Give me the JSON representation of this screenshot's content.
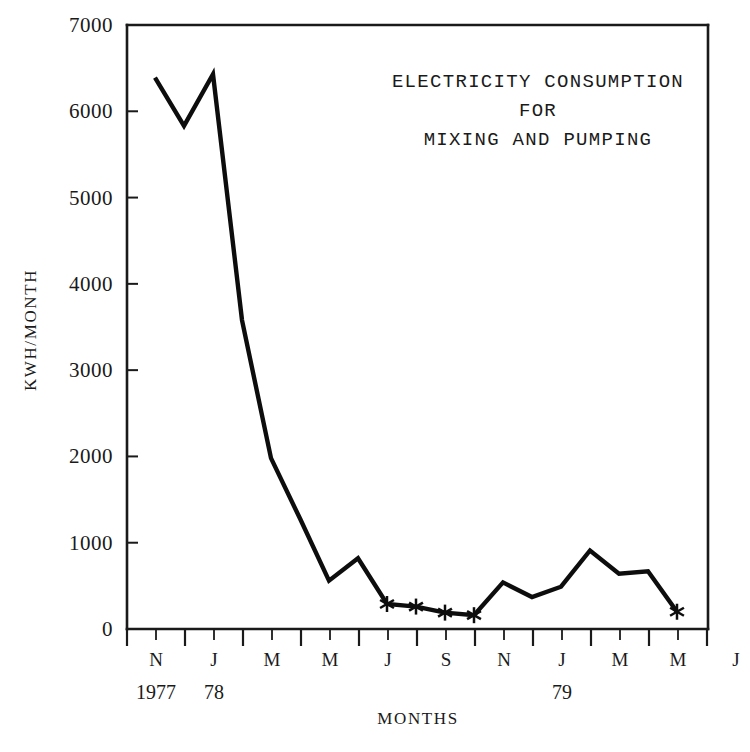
{
  "chart_data": {
    "type": "line",
    "title_lines": [
      "ELECTRICITY CONSUMPTION",
      "FOR",
      "MIXING AND PUMPING"
    ],
    "xlabel": "MONTHS",
    "ylabel": "KWH/MONTH",
    "ylim": [
      0,
      7000
    ],
    "ytick_labels": [
      "7000",
      "6000",
      "5000",
      "4000",
      "3000",
      "2000",
      "1000",
      "0"
    ],
    "ytick_values": [
      7000,
      6000,
      5000,
      4000,
      3000,
      2000,
      1000,
      0
    ],
    "xtick_labels": [
      "N",
      "J",
      "M",
      "M",
      "J",
      "S",
      "N",
      "J",
      "M",
      "M",
      "J"
    ],
    "year_labels": [
      {
        "text": "1977",
        "at_index": 0
      },
      {
        "text": "78",
        "at_index": 1
      },
      {
        "text": "79",
        "at_index": 7
      }
    ],
    "grid": false,
    "legend": "none",
    "marker_symbol": "asterisk",
    "line_color": "#0d0d0d",
    "series": [
      {
        "name": "Electricity consumption for mixing and pumping",
        "unit": "kWh/month",
        "x": [
          "1977-11",
          "1977-12",
          "1978-01",
          "1978-03",
          "1978-05",
          "1978-07",
          "1978-09",
          "1978-10",
          "1978-11",
          "1978-12",
          "1979-01",
          "1979-02",
          "1979-03",
          "1979-04",
          "1979-05",
          "1979-06",
          "1979-07",
          "1979-08",
          "1979-09"
        ],
        "values": [
          6390,
          5830,
          6430,
          3580,
          1980,
          1280,
          560,
          820,
          290,
          260,
          190,
          160,
          540,
          370,
          490,
          910,
          640,
          670,
          200
        ],
        "marked_indices": [
          8,
          9,
          10,
          11,
          18
        ]
      }
    ]
  },
  "figure": {
    "background_color": "#ffffff",
    "axis_color": "#1a1a1a"
  }
}
